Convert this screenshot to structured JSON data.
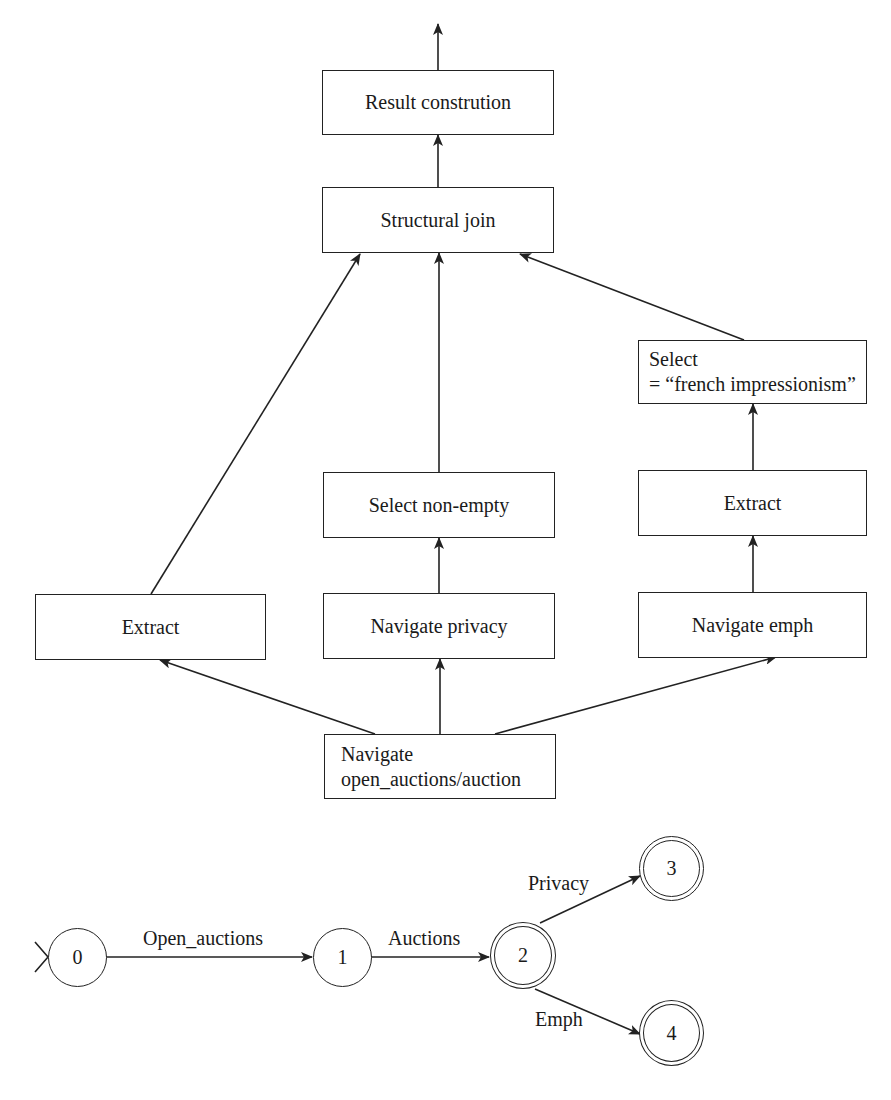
{
  "plan": {
    "nodes": {
      "result": "Result constrution",
      "join": "Structural join",
      "select_french_line1": "Select",
      "select_french_line2": "= “french impressionism”",
      "select_nonempty": "Select non-empty",
      "extract_right": "Extract",
      "extract_left": "Extract",
      "nav_privacy": "Navigate privacy",
      "nav_emph": "Navigate emph",
      "nav_root_line1": "Navigate",
      "nav_root_line2": "open_auctions/auction"
    }
  },
  "automaton": {
    "states": [
      {
        "id": "0",
        "final": false
      },
      {
        "id": "1",
        "final": false
      },
      {
        "id": "2",
        "final": true
      },
      {
        "id": "3",
        "final": true
      },
      {
        "id": "4",
        "final": true
      }
    ],
    "transitions": [
      {
        "from": "0",
        "to": "1",
        "label": "Open_auctions"
      },
      {
        "from": "1",
        "to": "2",
        "label": "Auctions"
      },
      {
        "from": "2",
        "to": "3",
        "label": "Privacy"
      },
      {
        "from": "2",
        "to": "4",
        "label": "Emph"
      }
    ]
  },
  "colors": {
    "stroke": "#222222",
    "background": "#ffffff"
  }
}
